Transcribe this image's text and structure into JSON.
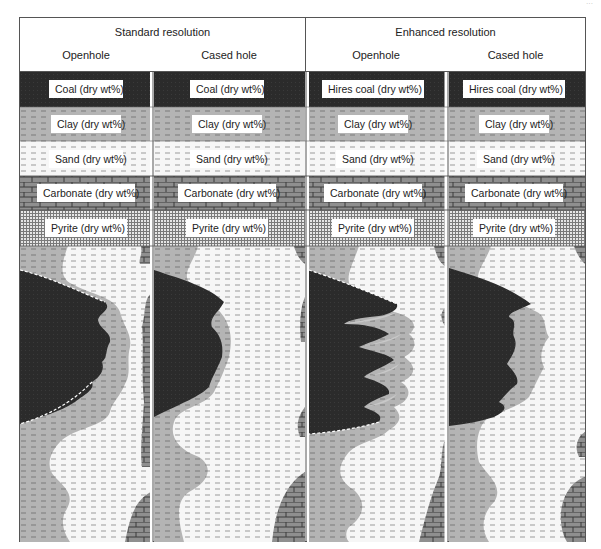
{
  "page_mark": "···",
  "header": {
    "groups": [
      {
        "title": "Standard resolution",
        "columns": [
          "Openhole",
          "Cased hole"
        ]
      },
      {
        "title": "Enhanced resolution",
        "columns": [
          "Openhole",
          "Cased hole"
        ]
      }
    ]
  },
  "legend": {
    "tracks": [
      [
        "Coal (dry wt%)",
        "Clay (dry wt%)",
        "Sand (dry wt%)",
        "Carbonate (dry wt%)",
        "Pyrite (dry wt%)"
      ],
      [
        "Coal (dry wt%)",
        "Clay (dry wt%)",
        "Sand (dry wt%)",
        "Carbonate (dry wt%)",
        "Pyrite (dry wt%)"
      ],
      [
        "Hires coal (dry wt%)",
        "Clay (dry wt%)",
        "Sand (dry wt%)",
        "Carbonate (dry wt%)",
        "Pyrite (dry wt%)"
      ],
      [
        "Hires coal (dry wt%)",
        "Clay (dry wt%)",
        "Sand (dry wt%)",
        "Carbonate (dry wt%)",
        "Pyrite (dry wt%)"
      ]
    ]
  },
  "colors": {
    "coal": "#2b2b2b",
    "clay": "#b4b4b4",
    "sand": "#f4f4f4",
    "carbonate": "#8c8c8c",
    "pyrite": "#d0d0d0",
    "frame": "#555555"
  }
}
